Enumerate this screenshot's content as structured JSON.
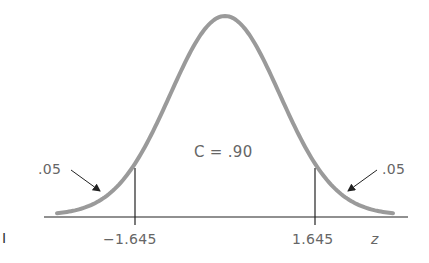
{
  "figure": {
    "center_label": "C = .90",
    "left_tail_label": ".05",
    "right_tail_label": ".05",
    "left_critical": "−1.645",
    "right_critical": "1.645",
    "axis_label": "z",
    "margin_mark": "I"
  },
  "colors": {
    "curve": "#9a9a9a",
    "lines": "#222222",
    "text": "#666666"
  }
}
